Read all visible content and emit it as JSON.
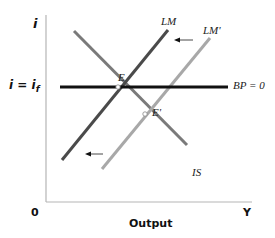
{
  "diagram": {
    "type": "IS-LM-BP diagram",
    "axes": {
      "y_label": "i",
      "x_label": "Output",
      "origin_label": "0",
      "x_end_label": "Y",
      "i_level_label": "i = i",
      "i_level_subscript": "f"
    },
    "curves": {
      "lm": {
        "label": "LM",
        "color": "#4a4a4a"
      },
      "lm_prime": {
        "label": "LM'",
        "color": "#a8a8a8"
      },
      "is": {
        "label": "IS",
        "color": "#7a7a7a"
      },
      "bp": {
        "label": "BP = 0",
        "color": "#111111"
      }
    },
    "points": {
      "e": {
        "label": "E"
      },
      "e_prime": {
        "label": "E'"
      }
    },
    "annotations": {
      "shift_arrow_top": "left arrow indicating LM' shifting to LM",
      "shift_arrow_bottom": "left arrow indicating LM' shifting to LM"
    },
    "colors": {
      "axis": "#b5b5b5",
      "background": "#ffffff"
    }
  }
}
